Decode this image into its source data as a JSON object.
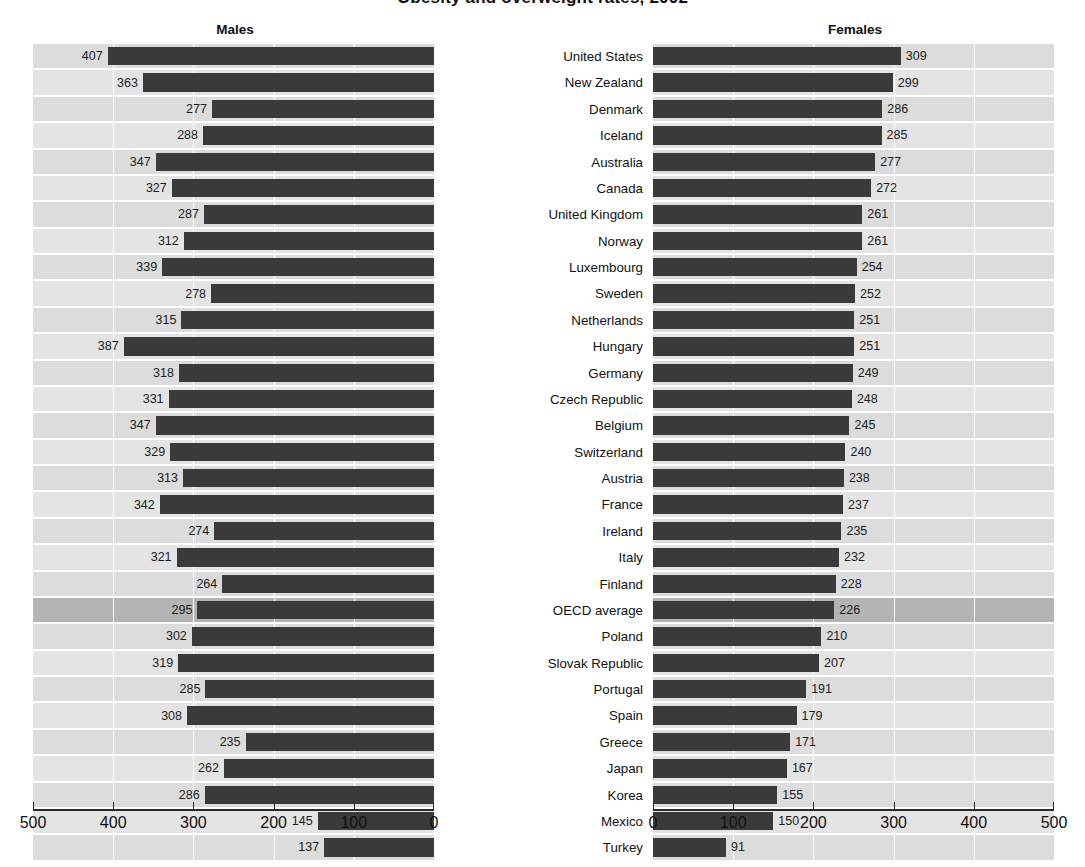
{
  "figure": {
    "title": "Obesity and overweight rates, 2002",
    "males_panel_label": "Males",
    "females_panel_label": "Females"
  },
  "axis": {
    "males_ticks": [
      "500",
      "400",
      "300",
      "200",
      "100",
      "0"
    ],
    "females_ticks": [
      "0",
      "100",
      "200",
      "300",
      "400",
      "500"
    ],
    "min": 0,
    "max": 500,
    "tick_step": 100
  },
  "colors": {
    "bar": "#3a3a3a",
    "row_band_light": "#e4e4e4",
    "row_band_dark": "#dcdcdc",
    "highlight_row": "#b4b4b4",
    "axis": "#2b2b2b",
    "text": "#111111",
    "background": "#ffffff"
  },
  "highlight_category": "OECD average",
  "chart_data": {
    "type": "bar",
    "title": "Obesity and overweight rates, 2002",
    "xlabel": "",
    "ylabel": "",
    "xlim": [
      0,
      500
    ],
    "grid": true,
    "legend": "none",
    "orientation": "horizontal-diverging",
    "categories": [
      "United States",
      "New Zealand",
      "Denmark",
      "Iceland",
      "Australia",
      "Canada",
      "United Kingdom",
      "Norway",
      "Luxembourg",
      "Sweden",
      "Netherlands",
      "Hungary",
      "Germany",
      "Czech Republic",
      "Belgium",
      "Switzerland",
      "Austria",
      "France",
      "Ireland",
      "Italy",
      "Finland",
      "OECD average",
      "Poland",
      "Slovak Republic",
      "Portugal",
      "Spain",
      "Greece",
      "Japan",
      "Korea",
      "Mexico",
      "Turkey"
    ],
    "series": [
      {
        "name": "Males",
        "direction": "left",
        "values": [
          407,
          363,
          277,
          288,
          347,
          327,
          287,
          312,
          339,
          278,
          315,
          387,
          318,
          331,
          347,
          329,
          313,
          342,
          274,
          321,
          264,
          295,
          302,
          319,
          285,
          308,
          235,
          262,
          286,
          145,
          137
        ]
      },
      {
        "name": "Females",
        "direction": "right",
        "values": [
          309,
          299,
          286,
          285,
          277,
          272,
          261,
          261,
          254,
          252,
          251,
          251,
          249,
          248,
          245,
          240,
          238,
          237,
          235,
          232,
          228,
          226,
          210,
          207,
          191,
          179,
          171,
          167,
          155,
          150,
          91
        ]
      }
    ]
  }
}
